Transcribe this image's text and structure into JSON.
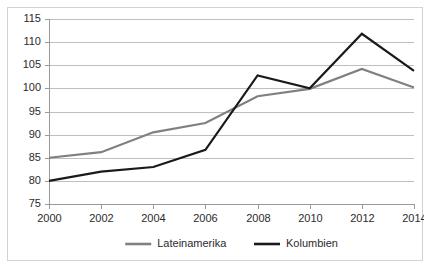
{
  "chart_data": {
    "type": "line",
    "title": "",
    "subtitle": "",
    "xlabel": "",
    "ylabel": "",
    "categories": [
      "2000",
      "2002",
      "2004",
      "2006",
      "2008",
      "2010",
      "2012",
      "2014"
    ],
    "x": [
      2000,
      2002,
      2004,
      2006,
      2008,
      2010,
      2012,
      2014
    ],
    "xlim": [
      2000,
      2014
    ],
    "ylim": [
      75,
      115
    ],
    "yticks": [
      75,
      80,
      85,
      90,
      95,
      100,
      105,
      110,
      115
    ],
    "ytick_labels": [
      "75",
      "80",
      "85",
      "90",
      "95",
      "100",
      "105",
      "110",
      "115"
    ],
    "xtick_labels": [
      "2000",
      "2002",
      "2004",
      "2006",
      "2008",
      "2010",
      "2012",
      "2014"
    ],
    "grid": "horizontal",
    "legend_position": "bottom-center",
    "series": [
      {
        "name": "Lateinamerika",
        "color": "#808080",
        "stroke_width": 2.2,
        "values": [
          85.0,
          86.2,
          90.5,
          92.5,
          98.3,
          99.9,
          104.2,
          100.2
        ]
      },
      {
        "name": "Kolumbien",
        "color": "#1a1a1a",
        "stroke_width": 2.2,
        "values": [
          80.0,
          82.0,
          83.0,
          86.7,
          102.8,
          100.0,
          111.8,
          103.8
        ]
      }
    ]
  },
  "legend": {
    "items": [
      {
        "label": "Lateinamerika",
        "color": "#808080"
      },
      {
        "label": "Kolumbien",
        "color": "#1a1a1a"
      }
    ]
  },
  "colors": {
    "lateinamerika": "#808080",
    "kolumbien": "#1a1a1a",
    "gridline": "#bfbfbf",
    "axis": "#9a9a9a",
    "border": "#d2d2d2",
    "background": "#ffffff",
    "text": "#2b2b2b"
  }
}
